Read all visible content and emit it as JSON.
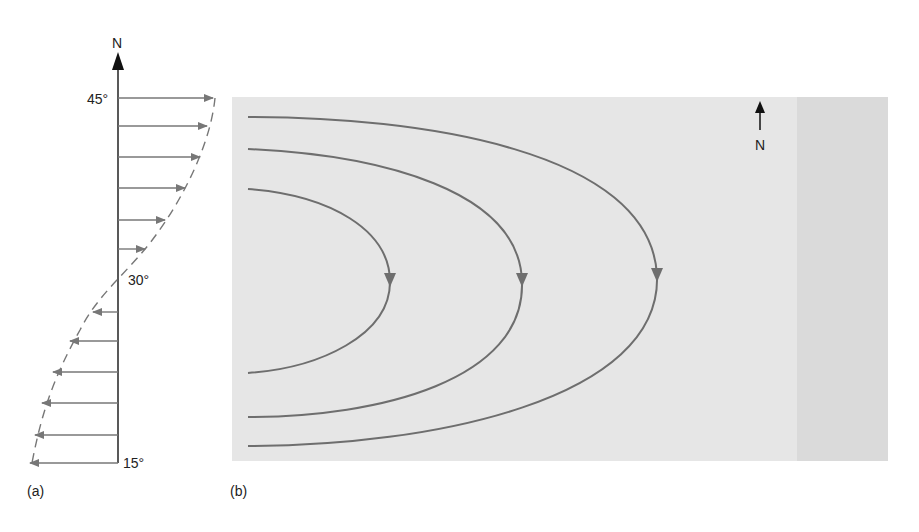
{
  "panel_a": {
    "label": "(a)",
    "north_label": "N",
    "latitude_labels": {
      "top": "45°",
      "middle": "30°",
      "bottom": "15°"
    },
    "arrow_color": "#777777",
    "axis_color": "#222222",
    "arrows": [
      {
        "y": 98,
        "x_end": 213,
        "direction": "east"
      },
      {
        "y": 126,
        "x_end": 207,
        "direction": "east"
      },
      {
        "y": 157,
        "x_end": 200,
        "direction": "east"
      },
      {
        "y": 188,
        "x_end": 185,
        "direction": "east"
      },
      {
        "y": 220,
        "x_end": 165,
        "direction": "east"
      },
      {
        "y": 249,
        "x_end": 145,
        "direction": "east"
      },
      {
        "y": 312,
        "x_end": 93,
        "direction": "west"
      },
      {
        "y": 341,
        "x_end": 70,
        "direction": "west"
      },
      {
        "y": 372,
        "x_end": 53,
        "direction": "west"
      },
      {
        "y": 403,
        "x_end": 42,
        "direction": "west"
      },
      {
        "y": 435,
        "x_end": 35,
        "direction": "west"
      },
      {
        "y": 463,
        "x_end": 30,
        "direction": "west"
      }
    ]
  },
  "panel_b": {
    "label": "(b)",
    "north_label": "N",
    "background_color": "#e6e6e6",
    "edge_strip_color": "#dadada",
    "line_color": "#6e6e6e",
    "streamlines": [
      {
        "name": "inner",
        "top_y": 189,
        "bottom_y": 373,
        "apex_x": 390
      },
      {
        "name": "middle",
        "top_y": 149,
        "bottom_y": 417,
        "apex_x": 522
      },
      {
        "name": "outer",
        "top_y": 117,
        "bottom_y": 446,
        "apex_x": 657
      }
    ]
  }
}
